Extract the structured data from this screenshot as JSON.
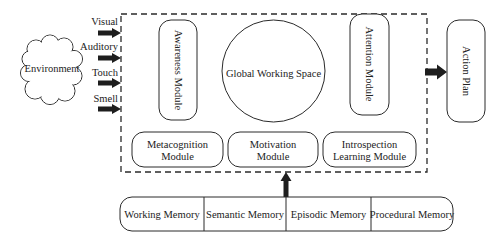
{
  "diagram": {
    "environment": {
      "label": "Environment"
    },
    "inputs": [
      {
        "label": "Visual"
      },
      {
        "label": "Auditory"
      },
      {
        "label": "Touch"
      },
      {
        "label": "Smell"
      }
    ],
    "modules": {
      "awareness": {
        "label": "Awareness Module"
      },
      "global_workspace": {
        "label": "Global Working Space"
      },
      "attention": {
        "label": "Attention Module"
      },
      "metacognition": {
        "lines": [
          "Metacognition",
          "Module"
        ]
      },
      "motivation": {
        "lines": [
          "Motivation",
          "Module"
        ]
      },
      "introspection": {
        "lines": [
          "Introspection",
          "Learning Module"
        ]
      }
    },
    "output": {
      "label": "Action Plan"
    },
    "memory": [
      {
        "label": "Working Memory"
      },
      {
        "label": "Semantic Memory"
      },
      {
        "label": "Episodic Memory"
      },
      {
        "label": "Procedural Memory"
      }
    ],
    "colors": {
      "stroke": "#2a2a2a",
      "arrow": "#1e1e1e",
      "background": "#ffffff"
    }
  }
}
